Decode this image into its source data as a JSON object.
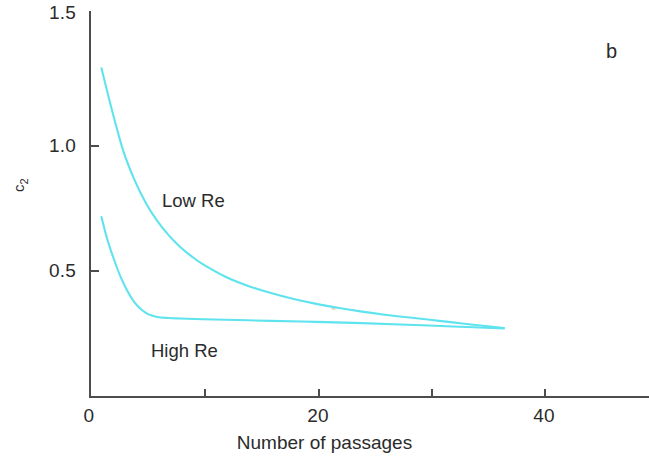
{
  "panel": {
    "label": "b"
  },
  "axes": {
    "xlabel": "Number of passages",
    "ylabel_text": "c",
    "ylabel_sub": "2",
    "xticklabels": [
      "0",
      "20",
      "40"
    ],
    "yticklabels": [
      "0.5",
      "1.0",
      "1.5"
    ]
  },
  "annotations": {
    "low_re": "Low Re",
    "high_re": "High Re"
  },
  "colors": {
    "curve": "#5fe3ee",
    "axis": "#4d4d4d",
    "text": "#2b2b2b",
    "background": "#ffffff"
  },
  "chart_data": {
    "type": "line",
    "title": "",
    "subtitle": "",
    "panel_label": "b",
    "xlabel": "Number of passages",
    "ylabel": "c2",
    "xlim": [
      0,
      49
    ],
    "ylim": [
      0,
      1.5
    ],
    "xticks": [
      0,
      10,
      20,
      30,
      40
    ],
    "xticklabels": [
      "0",
      "",
      "20",
      "",
      "40"
    ],
    "yticks": [
      0,
      0.5,
      1.0,
      1.5
    ],
    "yticklabels": [
      "",
      "0.5",
      "1.0",
      "1.5"
    ],
    "grid": false,
    "legend": "inline-annotations",
    "series": [
      {
        "name": "Low Re",
        "color": "#5fe3ee",
        "x": [
          1.1,
          2,
          3,
          4,
          5,
          6,
          7,
          8,
          9,
          10,
          12,
          14,
          16,
          18,
          20,
          22,
          24,
          26,
          28,
          30,
          32,
          34,
          36.5
        ],
        "y": [
          1.28,
          1.12,
          0.96,
          0.845,
          0.755,
          0.685,
          0.63,
          0.585,
          0.548,
          0.517,
          0.468,
          0.432,
          0.404,
          0.381,
          0.362,
          0.346,
          0.332,
          0.32,
          0.31,
          0.3,
          0.29,
          0.28,
          0.268
        ]
      },
      {
        "name": "High Re",
        "color": "#5fe3ee",
        "x": [
          1.1,
          1.6,
          2.2,
          2.8,
          3.4,
          4,
          4.6,
          5.2,
          6,
          7,
          8,
          10,
          13,
          16,
          20,
          24,
          28,
          32,
          36.5
        ],
        "y": [
          0.7,
          0.615,
          0.535,
          0.465,
          0.41,
          0.368,
          0.34,
          0.322,
          0.311,
          0.307,
          0.305,
          0.302,
          0.299,
          0.296,
          0.292,
          0.287,
          0.281,
          0.274,
          0.266
        ]
      }
    ]
  }
}
